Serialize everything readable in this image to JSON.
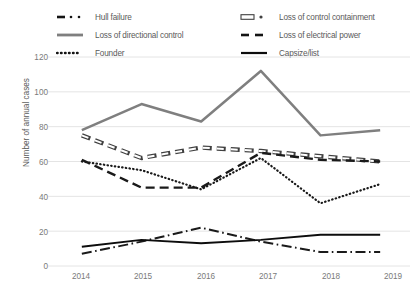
{
  "chart_data": {
    "type": "line",
    "title": "",
    "xlabel": "",
    "ylabel": "Number of annual cases",
    "categories": [
      "2014",
      "2015",
      "2016",
      "2017",
      "2018",
      "2019"
    ],
    "ylim": [
      0,
      120
    ],
    "yticks": [
      0,
      20,
      40,
      60,
      80,
      100,
      120
    ],
    "grid": "horizontal",
    "legend_position": "top",
    "series": [
      {
        "name": "Hull failure",
        "style": "dash-dot",
        "color": "#1a1a1a",
        "values": [
          7,
          14,
          22,
          14,
          8,
          8
        ]
      },
      {
        "name": "Loss of control containment",
        "style": "open-dash",
        "color": "#404040",
        "values": [
          75,
          62,
          68,
          66,
          63,
          60
        ]
      },
      {
        "name": "Loss of directional control",
        "style": "solid-gray",
        "color": "#7f7f7f",
        "values": [
          78,
          93,
          83,
          112,
          75,
          78
        ]
      },
      {
        "name": "Loss of electrical power",
        "style": "dashed",
        "color": "#1a1a1a",
        "values": [
          61,
          45,
          45,
          65,
          61,
          60
        ]
      },
      {
        "name": "Founder",
        "style": "dotted",
        "color": "#1a1a1a",
        "values": [
          60,
          55,
          44,
          62,
          36,
          47
        ]
      },
      {
        "name": "Capsize/list",
        "style": "solid-black",
        "color": "#0d0d0d",
        "values": [
          11,
          15,
          13,
          15,
          18,
          18
        ]
      }
    ]
  },
  "legend": {
    "items": [
      {
        "label": "Hull failure",
        "key": "legend-key-hull-failure"
      },
      {
        "label": "Loss of control containment",
        "key": "legend-key-loss-of-control-containment"
      },
      {
        "label": "Loss of directional control",
        "key": "legend-key-loss-of-directional-control"
      },
      {
        "label": "Loss of electrical power",
        "key": "legend-key-loss-of-electrical-power"
      },
      {
        "label": "Founder",
        "key": "legend-key-founder"
      },
      {
        "label": "Capsize/list",
        "key": "legend-key-capsize-list"
      }
    ]
  },
  "axes": {
    "y_title": "Number of annual cases",
    "y_labels": [
      "120",
      "100",
      "80",
      "60",
      "40",
      "20",
      "0"
    ],
    "x_labels": [
      "2014",
      "2015",
      "2016",
      "2017",
      "2018",
      "2019"
    ]
  },
  "colors": {
    "gridline": "#e4e4e4",
    "text": "#7a7a7a",
    "axis_title": "#5a5a5a",
    "gray_series": "#7f7f7f",
    "black_series": "#141414",
    "background": "#ffffff"
  }
}
